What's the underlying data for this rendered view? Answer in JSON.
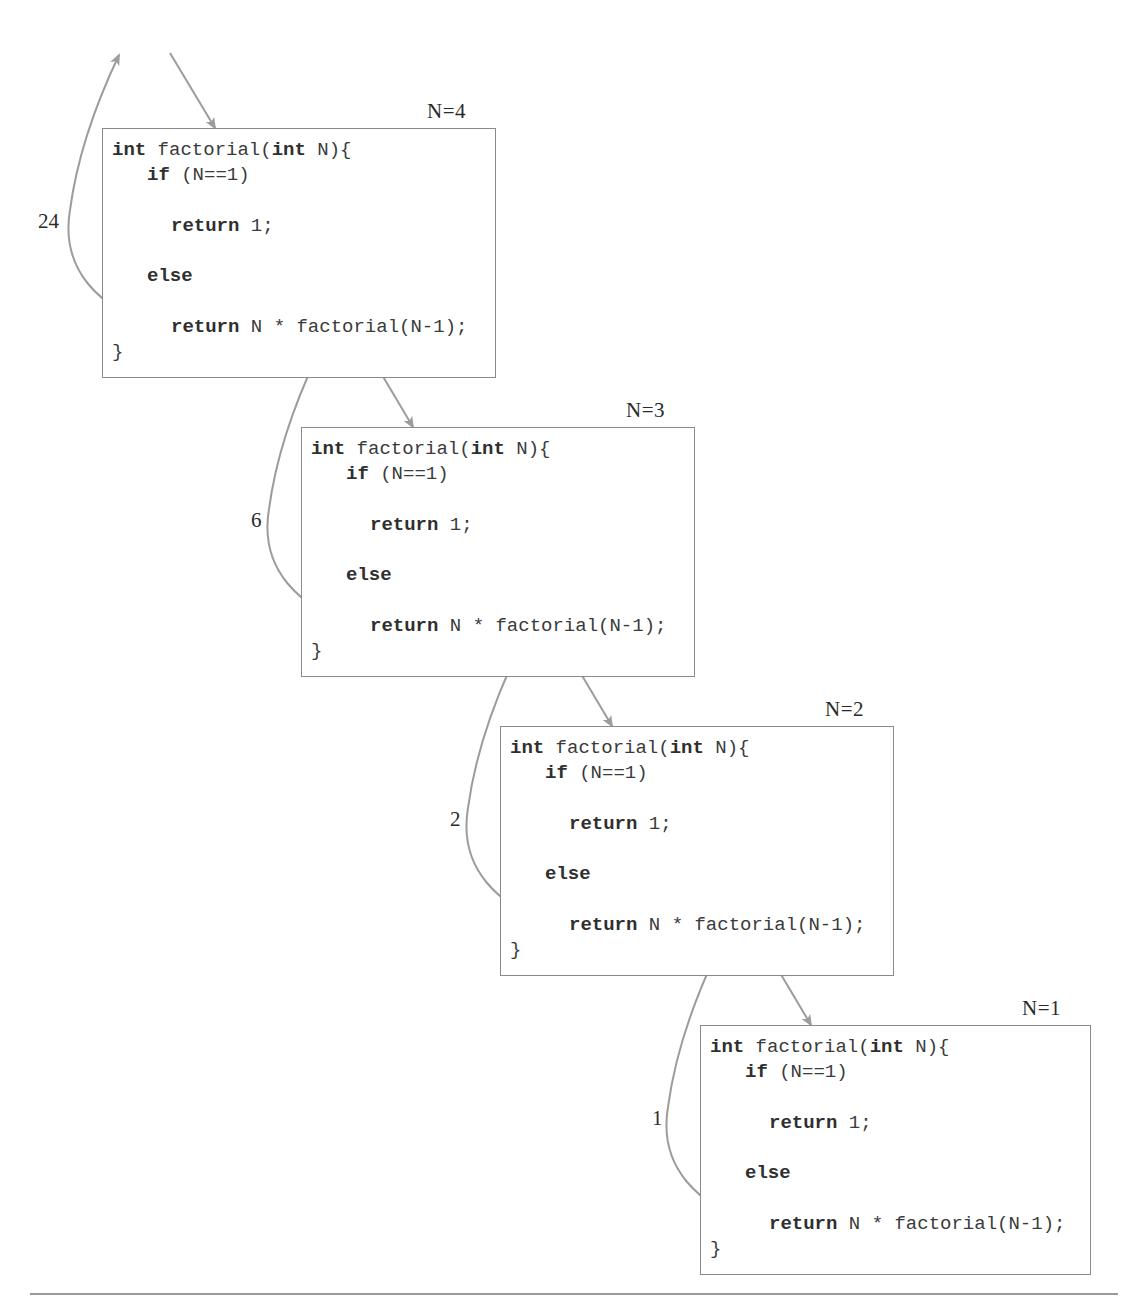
{
  "diagram": {
    "colors": {
      "arrow": "#9c9c9c",
      "frame_border": "#8a8a8a",
      "text": "#333333"
    },
    "code": {
      "line1_kw1": "int",
      "line1_mid": " factorial(",
      "line1_kw2": "int",
      "line1_end": " N){",
      "line2_kw": "if",
      "line2_rest": " (N==1)",
      "line3_kw": "return",
      "line3_rest": " 1;",
      "line4_kw": "else",
      "line5_kw": "return",
      "line5_rest": " N * factorial(N-1);",
      "line6": "}"
    },
    "frames": [
      {
        "label": "N=4",
        "return_value": "24"
      },
      {
        "label": "N=3",
        "return_value": "6"
      },
      {
        "label": "N=2",
        "return_value": "2"
      },
      {
        "label": "N=1",
        "return_value": "1"
      }
    ]
  }
}
